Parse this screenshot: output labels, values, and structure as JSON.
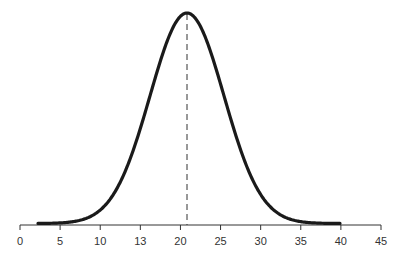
{
  "chart_data": {
    "type": "line",
    "title": "",
    "xlabel": "",
    "ylabel": "",
    "x_ticks": [
      "0",
      "5",
      "10",
      "13",
      "20",
      "25",
      "30",
      "35",
      "40",
      "45"
    ],
    "mean_marker": {
      "style": "dashed",
      "x_position_between_ticks": [
        "20",
        "25"
      ]
    },
    "curve": {
      "shape": "gaussian",
      "peak_x_fraction": 0.46,
      "sigma_ticks": 0.92,
      "start_tick_fraction": 0.45,
      "end_tick": "40"
    },
    "grid": false,
    "legend": null,
    "colors": {
      "curve": "#1a1a1a",
      "axis": "#333333",
      "dashed": "#333333"
    }
  }
}
